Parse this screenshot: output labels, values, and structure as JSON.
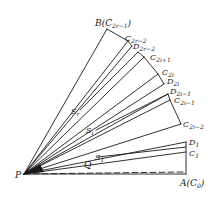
{
  "diagram": {
    "type": "geometric-fan",
    "stroke_color": "#1a1a1a",
    "points": {
      "P": {
        "label": "P",
        "x": 24,
        "y": 174
      },
      "A": {
        "label": "A",
        "paren": "C",
        "paren_sub": "0",
        "x": 186,
        "y": 174
      },
      "B": {
        "label": "B",
        "paren": "C",
        "paren_sub": "2r−1",
        "x": 107,
        "y": 29
      },
      "C2r2": {
        "label": "C",
        "sub": "2r−2",
        "x": 128,
        "y": 41
      },
      "D2r2": {
        "label": "D",
        "sub": "2r−2",
        "x": 132,
        "y": 46
      },
      "C2i1": {
        "label": "C",
        "sub": "2i+1",
        "x": 144,
        "y": 57
      },
      "C2i": {
        "label": "C",
        "sub": "2i",
        "x": 158,
        "y": 74
      },
      "D2i": {
        "label": "D",
        "sub": "2i",
        "x": 164,
        "y": 84
      },
      "D2im1": {
        "label": "D",
        "sub": "2i−1",
        "x": 168,
        "y": 94
      },
      "C2im1": {
        "label": "C",
        "sub": "2i−1",
        "x": 170,
        "y": 100
      },
      "C2im2": {
        "label": "C",
        "sub": "2i−2",
        "x": 181,
        "y": 124
      },
      "D1": {
        "label": "D",
        "sub": "1",
        "x": 186,
        "y": 142
      },
      "C1": {
        "label": "C",
        "sub": "1",
        "x": 186,
        "y": 152
      },
      "Q": {
        "label": "Q",
        "x": 85,
        "y": 165
      }
    },
    "regions": {
      "Sr": {
        "label": "S",
        "sub": "r"
      },
      "Si": {
        "label": "S",
        "sub": "i"
      },
      "S1": {
        "label": "S",
        "sub": "1"
      }
    },
    "labels": {
      "B": "B",
      "B_paren_open": "(",
      "B_paren_C": "C",
      "B_paren_sub": "2r−1",
      "B_paren_close": ")",
      "C2r2": "C",
      "C2r2_sub": "2r−2",
      "D2r2": "D",
      "D2r2_sub": "2r−2",
      "C2i1": "C",
      "C2i1_sub": "2i+1",
      "C2i": "C",
      "C2i_sub": "2i",
      "D2i": "D",
      "D2i_sub": "2i",
      "D2im1": "D",
      "D2im1_sub": "2i−1",
      "C2im1": "C",
      "C2im1_sub": "2i−1",
      "C2im2": "C",
      "C2im2_sub": "2i−2",
      "D1": "D",
      "D1_sub": "1",
      "C1": "C",
      "C1_sub": "1",
      "P": "P",
      "A": "A",
      "A_paren_open": "(",
      "A_paren_C": "C",
      "A_paren_sub": "0",
      "A_paren_close": ")",
      "Q": "Q",
      "Sr": "S",
      "Sr_sub": "r",
      "Si": "S",
      "Si_sub": "i",
      "S1": "S",
      "S1_sub": "1"
    }
  }
}
